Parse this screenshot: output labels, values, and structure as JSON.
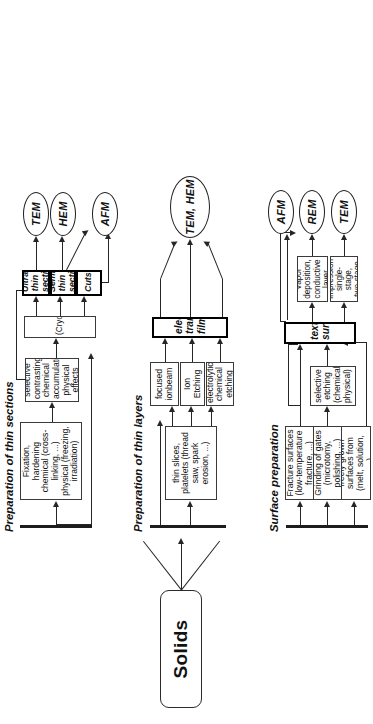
{
  "diagram": {
    "root": {
      "label": "Solids"
    },
    "groups": [
      {
        "id": "surface",
        "label": "Surface preparation"
      },
      {
        "id": "layers",
        "label": "Preparation of thin layers"
      },
      {
        "id": "sections",
        "label": "Preparation of thin sections"
      }
    ],
    "surface_preparation": {
      "sources": [
        {
          "id": "freely-grown",
          "label": "freely grown surfaces from (melt, solution, ...)"
        },
        {
          "id": "grinding",
          "label": "Grinding of gates (microtomy, polishing, ...)"
        },
        {
          "id": "fracture",
          "label": "Fracture surfaces (low-temperature fracture, ...)"
        }
      ],
      "treatment": {
        "id": "selective-etching",
        "label": "selective etching (chemical, physical)"
      },
      "intermediate": {
        "id": "textured-surfaces",
        "label": "textured surfaces"
      },
      "replication": [
        {
          "id": "impression",
          "label": "Impression single-stage, two-stage"
        },
        {
          "id": "vapor-deposition",
          "label": "Vapor deposition, conductive layer"
        }
      ],
      "outputs": [
        {
          "id": "tem",
          "label": "TEM"
        },
        {
          "id": "rem",
          "label": "REM"
        },
        {
          "id": "afm",
          "label": "AFM"
        }
      ]
    },
    "thin_layers": {
      "source": {
        "id": "thin-slices",
        "label": "thin slices, platelets (thread saw, spark erosion, ...)"
      },
      "thinning": [
        {
          "id": "electrolytic",
          "label": "electrolytic chemical etching"
        },
        {
          "id": "ion-etching",
          "label": "Ion Etching"
        },
        {
          "id": "focused-ionbeam",
          "label": "focused ionbeam"
        }
      ],
      "intermediate": {
        "id": "transparent-films",
        "label": "electron transparent films"
      },
      "outputs": [
        {
          "id": "tem-hem",
          "label": "TEM, HEM"
        }
      ]
    },
    "thin_sections": {
      "fixation": {
        "id": "fixation",
        "label": "Fixation, hardening chemical (cross-linking, ...) physical (freezing, irradiation)"
      },
      "contrasting": {
        "id": "contrasting",
        "label": "selective contrasting: chemical accumulation, physical effects"
      },
      "sectioning": {
        "id": "ultramicrotomy",
        "label": "(Cryo)Ultramicrotomy"
      },
      "products": [
        {
          "id": "cuts",
          "label": "Cuts"
        },
        {
          "id": "semi-thin",
          "label": "Semi-thin sections"
        },
        {
          "id": "ultra-thin",
          "label": "Ultra-thin sections"
        }
      ],
      "outputs": [
        {
          "id": "afm",
          "label": "AFM"
        },
        {
          "id": "hem",
          "label": "HEM"
        },
        {
          "id": "tem",
          "label": "TEM"
        }
      ]
    },
    "colors": {
      "stroke": "#262626",
      "emphasis_stroke": "#000000",
      "background": "#ffffff",
      "text": "#111111"
    }
  }
}
